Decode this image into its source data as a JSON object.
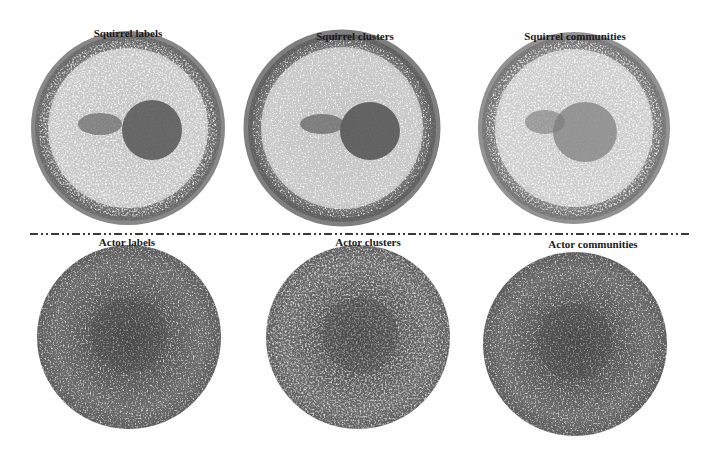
{
  "figure": {
    "panels": [
      {
        "id": "squirrel-labels",
        "title": "Squirrel labels",
        "row": "top",
        "cx": 128,
        "cy": 128,
        "r": 93,
        "pattern": "ring-with-core",
        "core_cx": 152,
        "core_cy": 130,
        "core_r": 30
      },
      {
        "id": "squirrel-clusters",
        "title": "Squirrel clusters",
        "row": "top",
        "cx": 342,
        "cy": 128,
        "r": 94,
        "pattern": "ring-with-core",
        "core_cx": 370,
        "core_cy": 130,
        "core_r": 30
      },
      {
        "id": "squirrel-communities",
        "title": "Squirrel communities",
        "row": "top",
        "cx": 574,
        "cy": 128,
        "r": 92,
        "pattern": "ring-with-core-light",
        "core_cx": 585,
        "core_cy": 130,
        "core_r": 30
      },
      {
        "id": "actor-labels",
        "title": "Actor labels",
        "row": "bottom",
        "cx": 129,
        "cy": 337,
        "r": 92,
        "pattern": "dense-disk"
      },
      {
        "id": "actor-clusters",
        "title": "Actor clusters",
        "row": "bottom",
        "cx": 358,
        "cy": 337,
        "r": 92,
        "pattern": "dense-disk"
      },
      {
        "id": "actor-communities",
        "title": "Actor communities",
        "row": "bottom",
        "cx": 575,
        "cy": 344,
        "r": 92,
        "pattern": "dense-disk"
      }
    ],
    "divider": {
      "style": "dash-dot",
      "y": 233
    }
  },
  "labels": {
    "squirrel_labels": "Squirrel labels",
    "squirrel_clusters": "Squirrel clusters",
    "squirrel_communities": "Squirrel communities",
    "actor_labels": "Actor labels",
    "actor_clusters": "Actor clusters",
    "actor_communities": "Actor communities"
  },
  "colors": {
    "ring": "#6b6b6b",
    "core": "#5a5a5a",
    "speckle_bg": "#ffffff",
    "title": "#1a1a1a",
    "divider": "#3a3a3a"
  }
}
